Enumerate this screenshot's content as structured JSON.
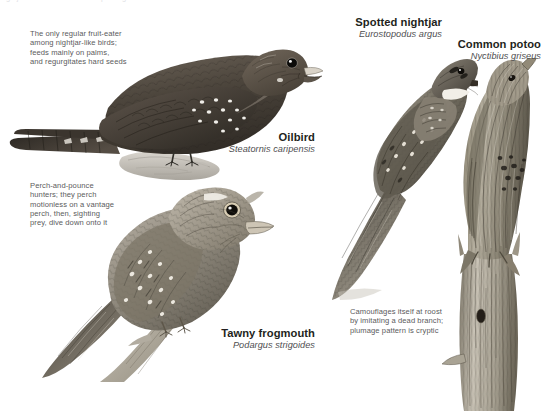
{
  "page": {
    "background_color": "#ffffff",
    "width": 545,
    "height": 411,
    "top_cut_text": "nightjars and allies  ·  order Caprimulgiformes  ·  nocturnal insectivores",
    "caption_color": "#5b5b5d",
    "label_color": "#231f20",
    "sci_name_color": "#4e4e50"
  },
  "captions": {
    "oilbird": "The only regular fruit-eater\namong nightjar-like birds;\nfeeds mainly on palms,\nand regurgitates hard seeds",
    "frogmouth": "Perch-and-pounce\nhunters; they perch\nmotionless on a vantage\nperch, then, sighting\nprey, dive down onto it",
    "potoo": "Camouflages itself at roost\nby imitating a dead branch;\nplumage pattern is cryptic"
  },
  "species": [
    {
      "key": "oilbird",
      "common": "Oilbird",
      "scientific": "Steatornis caripensis",
      "pose": "perched on rock, facing right, bill open",
      "plumage": "dark chocolate brown with white teardrop spots on wing coverts and wingtips"
    },
    {
      "key": "frogmouth",
      "common": "Tawny frogmouth",
      "scientific": "Podargus strigoides",
      "pose": "perched on diagonal branch, facing right",
      "plumage": "mottled grey-brown, streaked and vermiculated, pale spots on wing"
    },
    {
      "key": "nightjar",
      "common": "Spotted nightjar",
      "scientific": "Eurostopodus argus",
      "pose": "resting on ground at a diagonal, head upper right",
      "plumage": "cryptic grey-brown mottling with white throat patch and spotted wing"
    },
    {
      "key": "potoo",
      "common": "Common potoo",
      "scientific": "Nyctibius griseus",
      "pose": "upright on a vertical dead branch stump, bill pointed up",
      "plumage": "grey-brown bark-like streaking with dark flecks, cryptic"
    }
  ]
}
